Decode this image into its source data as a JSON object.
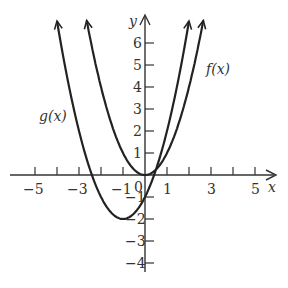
{
  "diagram": {
    "type": "function-graph",
    "axes": {
      "x_label": "x",
      "y_label": "y",
      "x_tick_labels": [
        "−5",
        "−3",
        "−1",
        "0",
        "1",
        "3",
        "5"
      ],
      "y_tick_labels": [
        "6",
        "5",
        "4",
        "3",
        "2",
        "1",
        "−1",
        "−2",
        "−3",
        "−4"
      ],
      "x_range": [
        -6,
        6
      ],
      "y_range": [
        -4.5,
        7
      ]
    },
    "curves": [
      {
        "name": "f(x)",
        "label": "f(x)",
        "expression": "x^2",
        "vertex": [
          0,
          0
        ]
      },
      {
        "name": "g(x)",
        "label": "g(x)",
        "expression": "(x+1)^2 - 2",
        "vertex": [
          -1,
          -2
        ]
      }
    ],
    "colors": {
      "curve": "#222222",
      "axis": "#333333",
      "text": "#333333"
    }
  }
}
